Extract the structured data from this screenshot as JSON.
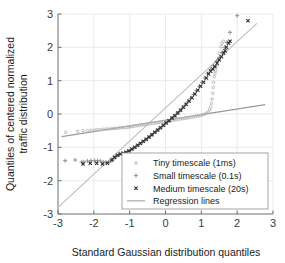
{
  "chart_data": {
    "type": "scatter",
    "title": "",
    "xlabel": "Standard Gaussian distribution quantiles",
    "ylabel_line1": "Quantiles of centered normalized",
    "ylabel_line2": "traffic distribution",
    "xlim": [
      -3,
      3
    ],
    "ylim": [
      -3,
      3
    ],
    "xticks": [
      "-3",
      "-2",
      "-1",
      "0",
      "1",
      "2",
      "3"
    ],
    "yticks": [
      "-3",
      "-2",
      "-1",
      "0",
      "1",
      "2",
      "3"
    ],
    "xtick_values": [
      -3,
      -2,
      -1,
      0,
      1,
      2,
      3
    ],
    "ytick_values": [
      -3,
      -2,
      -1,
      0,
      1,
      2,
      3
    ],
    "grid": true,
    "legend_position": "lower-right",
    "colors": {
      "tiny": "#b4b4b4",
      "small": "#8c8c8c",
      "medium": "#2d2d2d",
      "regression_steep": "#bdbdbd",
      "regression_shallow": "#9a9a9a",
      "axis": "#6e6e6e",
      "grid": "#e6e6e6"
    },
    "series": [
      {
        "name": "Tiny timescale (1ms)",
        "marker": "circle",
        "color": "#b4b4b4",
        "points": [
          [
            -2.78,
            -0.55
          ],
          [
            -2.45,
            -0.52
          ],
          [
            -2.3,
            -0.5
          ],
          [
            -2.18,
            -0.5
          ],
          [
            -2.08,
            -0.49
          ],
          [
            -1.98,
            -0.48
          ],
          [
            -1.9,
            -0.47
          ],
          [
            -1.82,
            -0.47
          ],
          [
            -1.74,
            -0.46
          ],
          [
            -1.66,
            -0.45
          ],
          [
            -1.58,
            -0.45
          ],
          [
            -1.5,
            -0.44
          ],
          [
            -1.43,
            -0.43
          ],
          [
            -1.36,
            -0.43
          ],
          [
            -1.29,
            -0.42
          ],
          [
            -1.22,
            -0.41
          ],
          [
            -1.15,
            -0.41
          ],
          [
            -1.08,
            -0.4
          ],
          [
            -1.02,
            -0.39
          ],
          [
            -0.96,
            -0.38
          ],
          [
            -0.9,
            -0.37
          ],
          [
            -0.84,
            -0.36
          ],
          [
            -0.78,
            -0.35
          ],
          [
            -0.72,
            -0.34
          ],
          [
            -0.66,
            -0.33
          ],
          [
            -0.6,
            -0.32
          ],
          [
            -0.54,
            -0.31
          ],
          [
            -0.48,
            -0.3
          ],
          [
            -0.42,
            -0.29
          ],
          [
            -0.36,
            -0.28
          ],
          [
            -0.3,
            -0.27
          ],
          [
            -0.24,
            -0.26
          ],
          [
            -0.18,
            -0.25
          ],
          [
            -0.12,
            -0.24
          ],
          [
            -0.06,
            -0.23
          ],
          [
            0.0,
            -0.22
          ],
          [
            0.06,
            -0.21
          ],
          [
            0.12,
            -0.2
          ],
          [
            0.18,
            -0.19
          ],
          [
            0.24,
            -0.18
          ],
          [
            0.3,
            -0.17
          ],
          [
            0.36,
            -0.16
          ],
          [
            0.42,
            -0.15
          ],
          [
            0.48,
            -0.14
          ],
          [
            0.54,
            -0.13
          ],
          [
            0.6,
            -0.12
          ],
          [
            0.66,
            -0.11
          ],
          [
            0.72,
            -0.1
          ],
          [
            0.78,
            -0.09
          ],
          [
            0.84,
            -0.07
          ],
          [
            0.9,
            -0.06
          ],
          [
            0.96,
            -0.05
          ],
          [
            1.02,
            -0.03
          ],
          [
            1.08,
            -0.01
          ],
          [
            1.14,
            0.02
          ],
          [
            1.19,
            0.06
          ],
          [
            1.23,
            0.12
          ],
          [
            1.26,
            0.2
          ],
          [
            1.28,
            0.32
          ],
          [
            1.3,
            0.45
          ],
          [
            1.32,
            0.62
          ],
          [
            1.33,
            0.8
          ],
          [
            1.34,
            0.95
          ],
          [
            1.36,
            1.12
          ],
          [
            1.38,
            1.22
          ],
          [
            1.4,
            1.3
          ],
          [
            1.43,
            1.45
          ],
          [
            1.46,
            1.62
          ],
          [
            1.5,
            1.82
          ],
          [
            1.55,
            2.02
          ],
          [
            1.58,
            2.12
          ],
          [
            1.62,
            2.18
          ]
        ]
      },
      {
        "name": "Small timescale (0.1s)",
        "marker": "plus",
        "color": "#8c8c8c",
        "points": [
          [
            -2.8,
            -1.4
          ],
          [
            -2.52,
            -1.38
          ],
          [
            -2.34,
            -1.44
          ],
          [
            -2.28,
            -1.44
          ],
          [
            -2.18,
            -1.41
          ],
          [
            -2.08,
            -1.4
          ],
          [
            -1.98,
            -1.4
          ],
          [
            -1.9,
            -1.4
          ],
          [
            -1.82,
            -1.41
          ],
          [
            -1.74,
            -1.44
          ],
          [
            -1.66,
            -1.45
          ],
          [
            -1.58,
            -1.45
          ],
          [
            -1.5,
            -1.4
          ],
          [
            -1.44,
            -1.34
          ],
          [
            -1.38,
            -1.28
          ],
          [
            -1.3,
            -1.22
          ],
          [
            -1.22,
            -1.18
          ],
          [
            -1.14,
            -1.16
          ],
          [
            -1.06,
            -1.14
          ],
          [
            -0.98,
            -1.1
          ],
          [
            -0.9,
            -1.04
          ],
          [
            -0.82,
            -0.98
          ],
          [
            -0.74,
            -0.92
          ],
          [
            -0.66,
            -0.86
          ],
          [
            -0.58,
            -0.8
          ],
          [
            -0.5,
            -0.73
          ],
          [
            -0.42,
            -0.66
          ],
          [
            -0.34,
            -0.59
          ],
          [
            -0.26,
            -0.52
          ],
          [
            -0.18,
            -0.45
          ],
          [
            -0.1,
            -0.38
          ],
          [
            -0.02,
            -0.3
          ],
          [
            0.06,
            -0.23
          ],
          [
            0.14,
            -0.16
          ],
          [
            0.22,
            -0.09
          ],
          [
            0.3,
            -0.01
          ],
          [
            0.38,
            0.07
          ],
          [
            0.46,
            0.16
          ],
          [
            0.54,
            0.26
          ],
          [
            0.62,
            0.36
          ],
          [
            0.7,
            0.47
          ],
          [
            0.78,
            0.58
          ],
          [
            0.86,
            0.7
          ],
          [
            0.94,
            0.82
          ],
          [
            1.02,
            0.95
          ],
          [
            1.1,
            1.08
          ],
          [
            1.18,
            1.22
          ],
          [
            1.26,
            1.33
          ],
          [
            1.34,
            1.45
          ],
          [
            1.42,
            1.58
          ],
          [
            1.5,
            1.7
          ],
          [
            1.58,
            1.85
          ],
          [
            1.66,
            2.0
          ],
          [
            1.72,
            2.15
          ],
          [
            1.8,
            2.45
          ],
          [
            2.0,
            2.95
          ]
        ]
      },
      {
        "name": "Medium timescale (20s)",
        "marker": "x",
        "color": "#2d2d2d",
        "points": [
          [
            -2.3,
            -1.5
          ],
          [
            -2.1,
            -1.48
          ],
          [
            -1.92,
            -1.48
          ],
          [
            -1.76,
            -1.5
          ],
          [
            -1.62,
            -1.48
          ],
          [
            -1.5,
            -1.38
          ],
          [
            -1.42,
            -1.3
          ],
          [
            -1.34,
            -1.24
          ],
          [
            -1.26,
            -1.2
          ],
          [
            -1.18,
            -1.18
          ],
          [
            -1.1,
            -1.15
          ],
          [
            -1.02,
            -1.1
          ],
          [
            -0.94,
            -1.05
          ],
          [
            -0.86,
            -1.0
          ],
          [
            -0.78,
            -0.94
          ],
          [
            -0.7,
            -0.88
          ],
          [
            -0.62,
            -0.82
          ],
          [
            -0.54,
            -0.76
          ],
          [
            -0.46,
            -0.69
          ],
          [
            -0.38,
            -0.62
          ],
          [
            -0.3,
            -0.55
          ],
          [
            -0.22,
            -0.48
          ],
          [
            -0.14,
            -0.41
          ],
          [
            -0.06,
            -0.34
          ],
          [
            0.02,
            -0.27
          ],
          [
            0.1,
            -0.2
          ],
          [
            0.18,
            -0.12
          ],
          [
            0.26,
            -0.05
          ],
          [
            0.34,
            0.03
          ],
          [
            0.42,
            0.11
          ],
          [
            0.5,
            0.2
          ],
          [
            0.58,
            0.29
          ],
          [
            0.66,
            0.39
          ],
          [
            0.74,
            0.49
          ],
          [
            0.82,
            0.6
          ],
          [
            0.9,
            0.71
          ],
          [
            0.98,
            0.83
          ],
          [
            1.06,
            0.95
          ],
          [
            1.14,
            1.08
          ],
          [
            1.2,
            1.2
          ],
          [
            1.26,
            1.28
          ],
          [
            1.32,
            1.35
          ],
          [
            1.38,
            1.42
          ],
          [
            1.44,
            1.52
          ],
          [
            1.5,
            1.62
          ],
          [
            1.56,
            1.72
          ],
          [
            1.62,
            1.82
          ],
          [
            1.66,
            1.9
          ],
          [
            1.7,
            2.0
          ],
          [
            1.76,
            2.12
          ],
          [
            1.8,
            2.18
          ],
          [
            2.3,
            2.8
          ]
        ]
      }
    ],
    "regression_lines": [
      {
        "name": "steep",
        "x1": -3.0,
        "y1": -2.8,
        "x2": 2.55,
        "y2": 2.72,
        "color": "#bdbdbd"
      },
      {
        "name": "shallow",
        "x1": -2.9,
        "y1": -0.68,
        "x2": 2.78,
        "y2": 0.28,
        "color": "#9a9a9a"
      }
    ],
    "legend": {
      "items": [
        {
          "label": "Tiny timescale (1ms)",
          "marker": "circle",
          "color": "#b4b4b4"
        },
        {
          "label": "Small timescale (0.1s)",
          "marker": "plus",
          "color": "#8c8c8c"
        },
        {
          "label": "Medium timescale (20s)",
          "marker": "x",
          "color": "#2d2d2d"
        },
        {
          "label": "Regression lines",
          "marker": "line",
          "color": "#bdbdbd"
        }
      ]
    }
  }
}
